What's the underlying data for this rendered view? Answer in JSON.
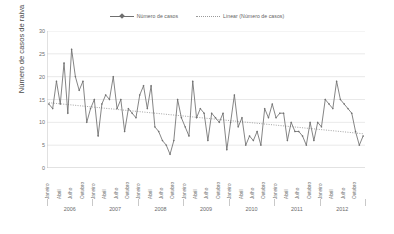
{
  "legend": {
    "series_label": "Número de casos",
    "trend_label": "Linear (Número de casos)"
  },
  "axes": {
    "ylabel": "Número de casos de raiva",
    "yticks": [
      "30",
      "25",
      "20",
      "15",
      "10",
      "5",
      "0"
    ]
  },
  "colors": {
    "series": "#6f6f6f",
    "trend": "#9a9a9a",
    "grid": "#e3e3e3",
    "axis": "#bdbdbd",
    "text": "#6a6a6a"
  },
  "chart_data": {
    "type": "line",
    "title": "",
    "xlabel": "",
    "ylabel": "Número de casos de raiva",
    "ylim": [
      0,
      30
    ],
    "ytick_values": [
      0,
      5,
      10,
      15,
      20,
      25,
      30
    ],
    "grid": true,
    "legend_position": "top-center",
    "years": [
      "2006",
      "2007",
      "2008",
      "2009",
      "2010",
      "2011",
      "2012"
    ],
    "months_per_year": 12,
    "quarter_tick_labels": [
      "Janeiro",
      "Abril",
      "Julho",
      "Outubro"
    ],
    "x_tick_labels": [
      "Janeiro",
      "Abril",
      "Julho",
      "Outubro",
      "Janeiro",
      "Abril",
      "Julho",
      "Outubro",
      "Janeiro",
      "Abril",
      "Julho",
      "Outubro",
      "Janeiro",
      "Abril",
      "Julho",
      "Outubro",
      "Janeiro",
      "Abril",
      "Julho",
      "Outubro",
      "Janeiro",
      "Abril",
      "Julho",
      "Outubro",
      "Janeiro",
      "Abril",
      "Julho",
      "Outubro"
    ],
    "series": [
      {
        "name": "Número de casos",
        "marker": "diamond",
        "values": [
          14,
          13,
          19,
          14,
          23,
          12,
          26,
          20,
          17,
          19,
          10,
          13,
          15,
          7,
          14,
          16,
          15,
          20,
          13,
          15,
          8,
          13,
          12,
          11,
          16,
          18,
          13,
          18,
          9,
          8,
          6,
          5,
          3,
          6,
          15,
          11,
          9,
          7,
          19,
          11,
          13,
          12,
          6,
          12,
          11,
          10,
          12,
          4,
          10,
          16,
          9,
          11,
          5,
          7,
          6,
          8,
          5,
          13,
          11,
          14,
          11,
          12,
          12,
          6,
          10,
          8,
          8,
          7,
          5,
          10,
          6,
          10,
          9,
          15,
          14,
          13,
          19,
          15,
          14,
          13,
          12,
          8,
          5,
          7
        ]
      },
      {
        "name": "Linear (Número de casos)",
        "type": "trendline",
        "style": "dotted",
        "start_value": 14.3,
        "end_value": 7.5
      }
    ]
  }
}
